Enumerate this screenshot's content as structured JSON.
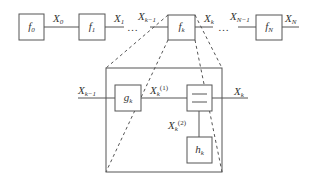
{
  "diagram": {
    "top_chain": {
      "blocks": [
        {
          "id": "f0",
          "base": "f",
          "sub": "0"
        },
        {
          "id": "f1",
          "base": "f",
          "sub": "1"
        },
        {
          "id": "fk",
          "base": "f",
          "sub": "k"
        },
        {
          "id": "fN",
          "base": "f",
          "sub": "N"
        }
      ],
      "signals": [
        {
          "base": "X",
          "sub": "0"
        },
        {
          "base": "X",
          "sub": "1"
        },
        {
          "base": "X",
          "sub": "k−1"
        },
        {
          "base": "X",
          "sub": "k"
        },
        {
          "base": "X",
          "sub": "N−1"
        },
        {
          "base": "X",
          "sub": "N"
        }
      ],
      "ellipsis": "…"
    },
    "detail": {
      "input": {
        "base": "X",
        "sub": "k−1"
      },
      "output": {
        "base": "X",
        "sub": "k"
      },
      "g_block": {
        "base": "g",
        "sub": "k"
      },
      "h_block": {
        "base": "h",
        "sub": "k"
      },
      "branch1": {
        "base": "X",
        "sub": "k",
        "sup": "(1)"
      },
      "branch2": {
        "base": "X",
        "sub": "k",
        "sup": "(2)"
      },
      "combiner_icon": "equals-combiner"
    },
    "colors": {
      "stroke": "#555555",
      "text": "#333333"
    }
  }
}
